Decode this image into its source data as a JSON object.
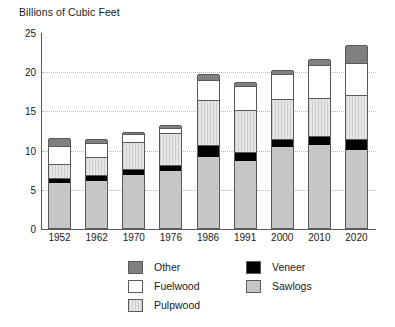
{
  "chart_data": {
    "type": "bar",
    "title": "Billions of Cubic Feet",
    "subtitle": "",
    "xlabel": "",
    "ylabel": "Billions of Cubic Feet",
    "stacked": true,
    "grid": true,
    "legend_position": "bottom",
    "ylim": [
      0,
      25
    ],
    "yticks": [
      0,
      5,
      10,
      15,
      20,
      25
    ],
    "ytick_labels": [
      "0",
      "5",
      "10",
      "15",
      "20",
      "25"
    ],
    "categories": [
      "1952",
      "1962",
      "1970",
      "1976",
      "1986",
      "1991",
      "2000",
      "2010",
      "2020"
    ],
    "series": [
      {
        "name": "Sawlogs",
        "color": "#c6c6c6",
        "values": [
          5.8,
          6.0,
          6.8,
          7.3,
          9.1,
          8.5,
          10.3,
          10.6,
          9.9
        ]
      },
      {
        "name": "Veneer",
        "color": "#000000",
        "values": [
          0.6,
          0.7,
          0.7,
          0.8,
          1.5,
          1.2,
          1.0,
          1.1,
          1.5
        ]
      },
      {
        "name": "Pulpwood",
        "color": "#dedede",
        "values": [
          1.8,
          2.3,
          3.5,
          4.0,
          5.7,
          5.4,
          5.1,
          4.9,
          5.6
        ]
      },
      {
        "name": "Fuelwood",
        "color": "#ffffff",
        "values": [
          2.3,
          1.9,
          1.0,
          0.6,
          2.6,
          3.0,
          3.3,
          4.2,
          4.0
        ]
      },
      {
        "name": "Other",
        "color": "#808080",
        "values": [
          1.0,
          0.5,
          0.3,
          0.4,
          0.7,
          0.5,
          0.5,
          0.7,
          2.3
        ]
      }
    ],
    "totals": [
      11.5,
      11.4,
      12.3,
      13.1,
      19.6,
      18.6,
      20.2,
      21.5,
      23.3
    ]
  },
  "legend": {
    "column1": [
      {
        "label": "Other",
        "swatch": "other"
      },
      {
        "label": "Fuelwood",
        "swatch": "fuelwood"
      },
      {
        "label": "Pulpwood",
        "swatch": "pulpwood"
      }
    ],
    "column2": [
      {
        "label": "Veneer",
        "swatch": "veneer"
      },
      {
        "label": "Sawlogs",
        "swatch": "sawlogs"
      }
    ]
  }
}
